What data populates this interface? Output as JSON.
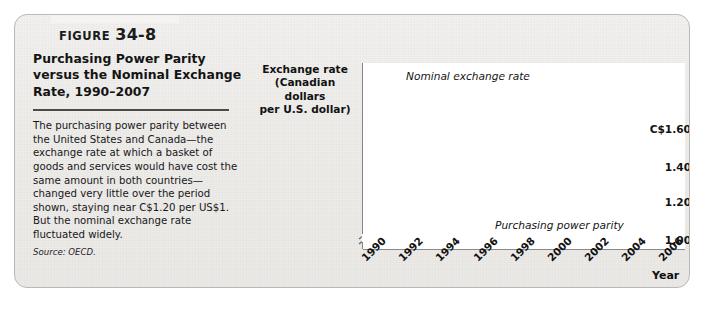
{
  "figure": {
    "label_word": "Figure",
    "number": "34-8",
    "title": "Purchasing Power Parity versus the Nominal Exchange Rate, 1990–2007",
    "body": "The purchasing power parity between the United States and Canada—the exchange rate at which a basket of goods and services would have cost the same amount in both countries—changed very little over the period shown, staying near C$1.20 per US$1. But the nominal exchange rate fluctuated widely.",
    "source_label": "Source:",
    "source_value": "OECD."
  },
  "colors": {
    "nominal_line": "#b0b0b0",
    "ppp_line": "#6e6e6e",
    "axis": "#6b6b6b",
    "panel_border": "#b9b9b9",
    "plot_background": "#ffffff",
    "text": "#121212"
  },
  "chart_data": {
    "type": "line",
    "ylabel": "Exchange rate (Canadian dollars per U.S. dollar)",
    "ylabel_lines": [
      "Exchange rate",
      "(Canadian dollars",
      "per U.S. dollar)"
    ],
    "xlabel": "Year",
    "ylim": [
      0.95,
      1.66
    ],
    "xlim": [
      1990,
      2007
    ],
    "yticks": [
      1.6,
      1.4,
      1.2,
      1.0
    ],
    "ytick_labels": [
      "C$1.60",
      "1.40",
      "1.20",
      "1.00"
    ],
    "xticks": [
      1990,
      1992,
      1994,
      1996,
      1998,
      2000,
      2002,
      2004,
      2006
    ],
    "xtick_labels": [
      "1990",
      "1992",
      "1994",
      "1996",
      "1998",
      "2000",
      "2002",
      "2004",
      "2006"
    ],
    "grid": false,
    "legend": "annotations",
    "axis_break_y": true,
    "x": [
      1990,
      1991,
      1992,
      1993,
      1994,
      1995,
      1996,
      1997,
      1998,
      1999,
      2000,
      2001,
      2002,
      2003,
      2004,
      2005,
      2006,
      2007
    ],
    "series": [
      {
        "name": "Nominal exchange rate",
        "color": "#b0b0b0",
        "annotation": "Nominal exchange rate",
        "values": [
          1.17,
          1.15,
          1.21,
          1.29,
          1.37,
          1.37,
          1.36,
          1.38,
          1.49,
          1.49,
          1.49,
          1.55,
          1.57,
          1.4,
          1.3,
          1.21,
          1.13,
          1.07
        ]
      },
      {
        "name": "Purchasing power parity",
        "color": "#6e6e6e",
        "annotation": "Purchasing power parity",
        "values": [
          1.25,
          1.24,
          1.23,
          1.22,
          1.21,
          1.21,
          1.2,
          1.2,
          1.21,
          1.24,
          1.23,
          1.24,
          1.24,
          1.24,
          1.23,
          1.22,
          1.22,
          1.22
        ]
      }
    ]
  }
}
